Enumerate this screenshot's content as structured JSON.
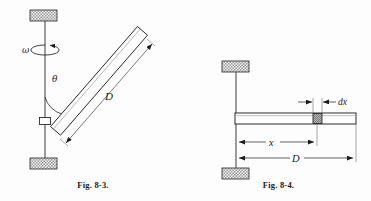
{
  "sheet": {
    "background_color": "#fdfdfd",
    "ink_color": "#1a1a1a",
    "hatch_color": "#9a9a9a",
    "width": 371,
    "height": 201
  },
  "figures": [
    {
      "id": "fig-8-3",
      "caption": "Fig. 8-3.",
      "description": "Rotating shaft with an inclined bar of length D attached by a collar; angular velocity omega about the vertical shaft, angle theta between shaft and bar.",
      "labels": {
        "omega": "ω",
        "theta": "θ",
        "length": "D"
      },
      "label_positions": {
        "omega": {
          "x": 22,
          "y": 50
        },
        "theta": {
          "x": 55,
          "y": 78
        },
        "length": {
          "x": 110,
          "y": 97
        }
      },
      "geometry": {
        "shaft_x": 45,
        "shaft_top_y": 21,
        "shaft_bottom_y": 158,
        "top_block": {
          "x": 30,
          "y": 10,
          "w": 27,
          "h": 11
        },
        "bottom_block": {
          "x": 30,
          "y": 158,
          "w": 27,
          "h": 11
        },
        "collar": {
          "cx": 45,
          "cy": 121,
          "w": 11,
          "h": 7
        },
        "bar": {
          "start": {
            "x": 55,
            "y": 131
          },
          "end": {
            "x": 142,
            "y": 31
          },
          "thickness": 16
        },
        "rotation_ellipse": {
          "cx": 45,
          "cy": 50,
          "rx": 14,
          "ry": 5
        },
        "dimension_D": {
          "from": {
            "x": 66,
            "y": 143
          },
          "to": {
            "x": 152,
            "y": 44
          }
        }
      }
    },
    {
      "id": "fig-8-4",
      "caption": "Fig. 8-4.",
      "description": "Vertical shaft between two supports with a horizontal bar of length D; a differential element dx is located at distance x from the shaft.",
      "labels": {
        "element": "dx",
        "distance": "x",
        "length": "D"
      },
      "label_positions": {
        "element": {
          "x": 338,
          "y": 105
        },
        "distance": {
          "x": 272,
          "y": 146
        },
        "length": {
          "x": 296,
          "y": 162
        }
      },
      "geometry": {
        "shaft_x": 236,
        "shaft_top_y": 72,
        "shaft_bottom_y": 168,
        "top_block": {
          "x": 222,
          "y": 61,
          "w": 27,
          "h": 11
        },
        "bottom_block": {
          "x": 222,
          "y": 168,
          "w": 27,
          "h": 11
        },
        "bar": {
          "x": 235,
          "y": 113,
          "w": 121,
          "h": 11
        },
        "element_dx": {
          "x": 313,
          "y": 113,
          "w": 9,
          "h": 11
        },
        "dimension_dx": {
          "y": 100,
          "left": 297,
          "right": 338
        },
        "dimension_x": {
          "y": 142,
          "from": 236,
          "to": 317
        },
        "dimension_D": {
          "y": 158,
          "from": 236,
          "to": 356
        }
      }
    }
  ]
}
